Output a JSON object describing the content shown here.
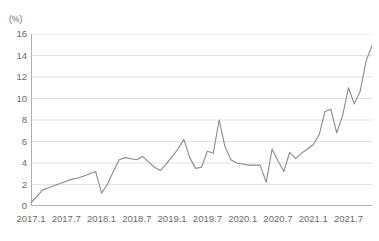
{
  "chart_data": {
    "type": "line",
    "title": "",
    "xlabel": "",
    "ylabel": "(%)",
    "ylim": [
      0,
      16
    ],
    "yticks": [
      0,
      2,
      4,
      6,
      8,
      10,
      12,
      14,
      16
    ],
    "grid": true,
    "legend": "none",
    "line_color": "#8a8a8a",
    "grid_color": "#e2e2e2",
    "axis_color": "#b0b0b0",
    "categories": [
      "2017.1",
      "2017.2",
      "2017.3",
      "2017.4",
      "2017.5",
      "2017.6",
      "2017.7",
      "2017.8",
      "2017.9",
      "2017.10",
      "2017.11",
      "2017.12",
      "2018.1",
      "2018.2",
      "2018.3",
      "2018.4",
      "2018.5",
      "2018.6",
      "2018.7",
      "2018.8",
      "2018.9",
      "2018.10",
      "2018.11",
      "2018.12",
      "2019.1",
      "2019.2",
      "2019.3",
      "2019.4",
      "2019.5",
      "2019.6",
      "2019.7",
      "2019.8",
      "2019.9",
      "2019.10",
      "2019.11",
      "2019.12",
      "2020.1",
      "2020.2",
      "2020.3",
      "2020.4",
      "2020.5",
      "2020.6",
      "2020.7",
      "2020.8",
      "2020.9",
      "2020.10",
      "2020.11",
      "2020.12",
      "2021.1",
      "2021.2",
      "2021.3",
      "2021.4",
      "2021.5",
      "2021.6",
      "2021.7",
      "2021.8",
      "2021.9",
      "2021.10",
      "2021.11"
    ],
    "values": [
      0.3,
      0.9,
      1.5,
      1.7,
      1.9,
      2.1,
      2.3,
      2.5,
      2.6,
      2.8,
      3.0,
      3.2,
      1.2,
      2.0,
      3.2,
      4.3,
      4.5,
      4.4,
      4.3,
      4.6,
      4.1,
      3.6,
      3.3,
      3.9,
      4.6,
      5.3,
      6.2,
      4.5,
      3.5,
      3.6,
      5.1,
      4.9,
      8.0,
      5.5,
      4.3,
      4.0,
      3.9,
      3.8,
      3.8,
      3.8,
      2.2,
      5.3,
      4.2,
      3.2,
      5.0,
      4.4,
      4.9,
      5.3,
      5.7,
      6.6,
      8.8,
      9.0,
      6.8,
      8.4,
      11.0,
      9.5,
      10.7,
      13.5,
      14.9
    ],
    "xtick_labels": [
      "2017.1",
      "2017.7",
      "2018.1",
      "2018.7",
      "2019.1",
      "2019.7",
      "2020.1",
      "2020.7",
      "2021.1",
      "2021.7"
    ],
    "xtick_indices": [
      0,
      6,
      12,
      18,
      24,
      30,
      36,
      42,
      48,
      54
    ]
  }
}
